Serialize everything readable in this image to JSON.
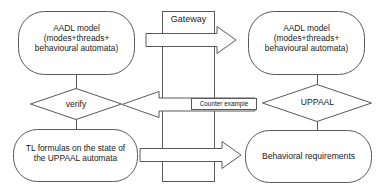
{
  "diagram": {
    "colors": {
      "stroke": "#595959",
      "fill": "#ffffff",
      "text": "#1a1a1a"
    },
    "nodes": [
      {
        "id": "aadl-model-left",
        "shape": "rounded-rectangle",
        "label": "AADL model\n(modes+threads+\nbehavioural automata)"
      },
      {
        "id": "gateway",
        "shape": "rectangle",
        "label": "Gateway"
      },
      {
        "id": "aadl-model-right",
        "shape": "rounded-rectangle",
        "label": "AADL model\n(modes+threads+\nbehavioural automata)"
      },
      {
        "id": "verify",
        "shape": "diamond",
        "label": "verify"
      },
      {
        "id": "counter-example",
        "shape": "label-rectangle",
        "label": "Counter example"
      },
      {
        "id": "uppaal",
        "shape": "diamond",
        "label": "UPPAAL"
      },
      {
        "id": "tl-formulas",
        "shape": "rounded-rectangle",
        "label": "TL formulas on the state of\nthe UPPAAL automata"
      },
      {
        "id": "behavioral-requirements",
        "shape": "rounded-rectangle",
        "label": "Behavioral requirements"
      }
    ],
    "edges": [
      {
        "id": "arrow-top",
        "from": "aadl-model-left",
        "to": "aadl-model-right",
        "style": "block-arrow",
        "direction": "right"
      },
      {
        "id": "arrow-counter-example",
        "from": "uppaal",
        "to": "verify",
        "style": "block-arrow",
        "direction": "left",
        "label": "Counter example"
      },
      {
        "id": "arrow-bottom",
        "from": "tl-formulas",
        "to": "behavioral-requirements",
        "style": "block-arrow",
        "direction": "right"
      },
      {
        "id": "connector-left-top",
        "from": "aadl-model-left",
        "to": "verify",
        "style": "line"
      },
      {
        "id": "connector-left-bottom",
        "from": "verify",
        "to": "tl-formulas",
        "style": "line"
      },
      {
        "id": "connector-right-top",
        "from": "aadl-model-right",
        "to": "uppaal",
        "style": "line"
      },
      {
        "id": "connector-right-bottom",
        "from": "uppaal",
        "to": "behavioral-requirements",
        "style": "line"
      }
    ]
  }
}
